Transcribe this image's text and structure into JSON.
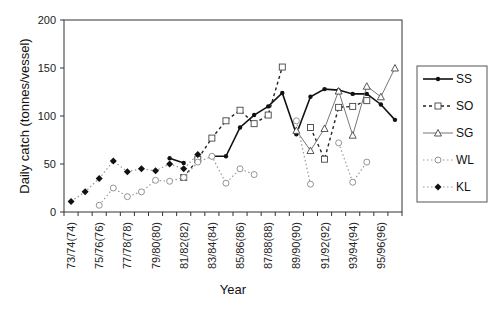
{
  "chart_data": {
    "type": "line",
    "title": "",
    "xlabel": "Year",
    "ylabel": "Daily catch (tonnes/vessel)",
    "ylim": [
      0,
      200
    ],
    "yticks": [
      0,
      50,
      100,
      150,
      200
    ],
    "grid": false,
    "legend_position": "right",
    "categories": [
      "73/74(74)",
      "74/75(75)",
      "75/76(76)",
      "76/77(77)",
      "77/78(78)",
      "78/79(79)",
      "79/80(80)",
      "80/81(81)",
      "81/82(82)",
      "82/83(83)",
      "83/84(84)",
      "84/85(85)",
      "85/86(86)",
      "86/87(87)",
      "87/88(88)",
      "88/89(89)",
      "89/90(90)",
      "90/91(91)",
      "91/92(92)",
      "92/93(93)",
      "93/94(94)",
      "94/95(95)",
      "95/96(96)",
      "96/97(97)"
    ],
    "xtick_labels_shown": [
      "73/74(74)",
      "75/76(76)",
      "77/78(78)",
      "79/80(80)",
      "81/82(82)",
      "83/84(84)",
      "85/86(86)",
      "87/88(88)",
      "89/90(90)",
      "91/92(92)",
      "93/94(94)",
      "95/96(96)"
    ],
    "series": [
      {
        "name": "SS",
        "style": "solid",
        "marker": "filled-circle",
        "values": [
          null,
          null,
          null,
          null,
          null,
          null,
          null,
          56,
          51,
          null,
          58,
          58,
          88,
          101,
          110,
          124,
          81,
          120,
          128,
          127,
          123,
          123,
          112,
          96
        ]
      },
      {
        "name": "SO",
        "style": "dashed",
        "marker": "open-square",
        "values": [
          null,
          null,
          null,
          null,
          null,
          null,
          null,
          null,
          36,
          55,
          77,
          95,
          106,
          92,
          101,
          151,
          null,
          88,
          55,
          109,
          110,
          116,
          null,
          null
        ]
      },
      {
        "name": "SG",
        "style": "solid-thin",
        "marker": "open-triangle",
        "values": [
          null,
          null,
          null,
          null,
          null,
          null,
          null,
          null,
          null,
          null,
          null,
          null,
          null,
          null,
          null,
          null,
          85,
          64,
          87,
          126,
          80,
          131,
          120,
          150
        ]
      },
      {
        "name": "WL",
        "style": "dotted",
        "marker": "open-circle",
        "values": [
          null,
          null,
          7,
          25,
          16,
          21,
          33,
          32,
          36,
          52,
          58,
          30,
          45,
          39,
          null,
          null,
          95,
          29,
          null,
          72,
          31,
          52,
          null,
          null
        ]
      },
      {
        "name": "KL",
        "style": "dotted",
        "marker": "filled-diamond",
        "values": [
          11,
          21,
          35,
          53,
          42,
          45,
          43,
          50,
          45,
          60,
          null,
          null,
          null,
          null,
          null,
          null,
          null,
          null,
          null,
          null,
          null,
          null,
          null,
          null
        ]
      }
    ]
  },
  "legend": {
    "items": [
      {
        "label": "SS"
      },
      {
        "label": "SO"
      },
      {
        "label": "SG"
      },
      {
        "label": "WL"
      },
      {
        "label": "KL"
      }
    ]
  },
  "colors": {
    "line": "#111111",
    "dotted": "#888888",
    "frame": "#333333"
  }
}
